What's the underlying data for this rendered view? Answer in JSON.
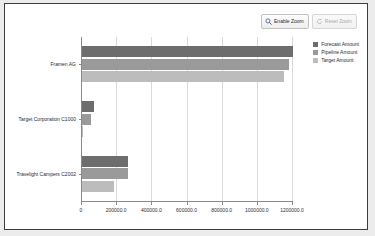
{
  "toolbar": {
    "enable_zoom_label": "Enable Zoom",
    "reset_zoom_label": "Reset Zoom",
    "enable_zoom_icon": "magnifier-icon",
    "reset_zoom_icon": "reset-icon"
  },
  "colors": {
    "forecast": "#6d6d6d",
    "pipeline": "#9a9a9a",
    "target": "#bcbcbc",
    "axis": "#8a8a8a",
    "grid": "#d9d9d9",
    "panel_border": "#3d3d3d",
    "page_background": "#ececed",
    "panel_background": "#ffffff",
    "text": "#2b2b2b"
  },
  "chart_data": {
    "type": "bar",
    "orientation": "horizontal",
    "title": "",
    "xlabel": "",
    "ylabel": "",
    "categories": [
      "Framen AG",
      "Target Corporation C1000",
      "Travelight Campers C2002"
    ],
    "series": [
      {
        "name": "Forecast Amount",
        "values": [
          1200000,
          68000,
          262000
        ]
      },
      {
        "name": "Pipeline Amount",
        "values": [
          1180000,
          51000,
          262000
        ]
      },
      {
        "name": "Target Amount",
        "values": [
          1150000,
          5000,
          182000
        ]
      }
    ],
    "xlim": [
      0,
      1200000
    ],
    "xticks": [
      0,
      200000,
      400000,
      600000,
      800000,
      1000000,
      1200000
    ],
    "xtick_labels": [
      "0",
      "200000.0",
      "400000.0",
      "600000.0",
      "800000.0",
      "1000000.0",
      "1200000.0"
    ],
    "grid": true,
    "legend_position": "top-right"
  }
}
